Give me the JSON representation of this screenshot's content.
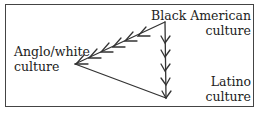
{
  "diagram": {
    "nodes": [
      {
        "id": "anglo",
        "line1": "Anglo/white",
        "line2": "culture"
      },
      {
        "id": "black",
        "line1": "Black American",
        "line2": "culture"
      },
      {
        "id": "latino",
        "line1": "Latino",
        "line2": "culture"
      }
    ],
    "edges": [
      {
        "from": "black",
        "to": "anglo",
        "style": "multi-arrow"
      },
      {
        "from": "black",
        "to": "latino",
        "style": "multi-arrow"
      },
      {
        "from": "anglo",
        "to": "latino",
        "style": "plain-line"
      }
    ],
    "colors": {
      "line": "#333333",
      "text": "#222222"
    }
  }
}
